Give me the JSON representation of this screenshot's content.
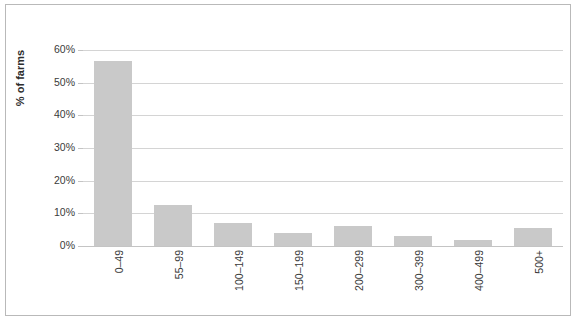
{
  "chart_data": {
    "type": "bar",
    "title": "",
    "subtitle": "",
    "xlabel": "",
    "ylabel": "% of farms",
    "categories": [
      "0–49",
      "55–99",
      "100–149",
      "150–199",
      "200–299",
      "300–399",
      "400–499",
      "500+"
    ],
    "values": [
      56.5,
      12.5,
      7.0,
      4.0,
      6.0,
      3.0,
      1.7,
      5.5
    ],
    "ylim": [
      0,
      60
    ],
    "ytick_values": [
      0,
      10,
      20,
      30,
      40,
      50,
      60
    ],
    "ytick_labels": [
      "0%",
      "10%",
      "20%",
      "30%",
      "40%",
      "50%",
      "60%"
    ],
    "grid": true,
    "grid_axis": "y",
    "legend": false,
    "legend_position": "none",
    "bar_color": "#c9c9c9",
    "gridline_color": "#d4d4d4",
    "axis_text_color": "#3a3a3a",
    "frame_border_color": "#b9b9b9",
    "background_color": "#ffffff",
    "xtick_rotation": 90
  }
}
